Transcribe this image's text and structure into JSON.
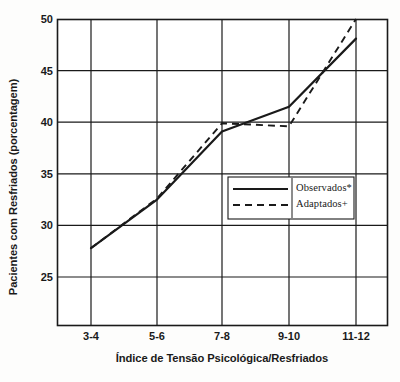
{
  "chart_data": {
    "type": "line",
    "title": "",
    "xlabel": "Índice de Tensão Psicológica/Resfriados",
    "ylabel": "Pacientes com Resfriados (porcentagem)",
    "categories": [
      "3-4",
      "5-6",
      "7-8",
      "9-10",
      "11-12"
    ],
    "yticks": [
      25,
      30,
      35,
      40,
      45,
      50
    ],
    "ylim": [
      21.5,
      50
    ],
    "grid": true,
    "legend_position": "center-right",
    "series": [
      {
        "name": "Observados*",
        "style": "solid",
        "color": "#1a1a1a",
        "values": [
          27.8,
          32.5,
          39.1,
          41.5,
          48.1
        ]
      },
      {
        "name": "Adaptados+",
        "style": "dashed",
        "color": "#1a1a1a",
        "values": [
          27.8,
          32.6,
          39.9,
          39.6,
          50.0
        ]
      }
    ]
  },
  "legend": {
    "items": [
      {
        "label": "Observados*",
        "style": "solid"
      },
      {
        "label": "Adaptados+",
        "style": "dashed"
      }
    ]
  },
  "axis": {
    "y_tick_labels": [
      "50",
      "45",
      "40",
      "35",
      "30",
      "25"
    ],
    "x_tick_labels": [
      "3-4",
      "5-6",
      "7-8",
      "9-10",
      "11-12"
    ]
  }
}
